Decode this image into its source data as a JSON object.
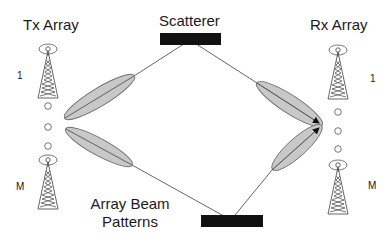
{
  "diagram": {
    "tx_array": {
      "label": "Tx Array",
      "element_first": "1",
      "element_last": "M"
    },
    "rx_array": {
      "label": "Rx Array",
      "element_first": "1",
      "element_last": "M"
    },
    "scatterer": {
      "label": "Scatterer"
    },
    "beam_patterns": {
      "line1": "Array Beam",
      "line2": "Patterns"
    },
    "colors": {
      "beam_fill": "#c8c8c8",
      "beam_stroke": "#6e6e6e",
      "scatterer_fill": "#111111",
      "line": "#555555",
      "text": "#1a1a1a"
    }
  }
}
